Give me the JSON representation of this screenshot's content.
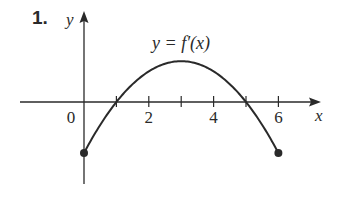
{
  "problem_number": "1.",
  "chart_data": {
    "type": "line",
    "title": "",
    "curve_label": "y = f′(x)",
    "xlabel": "x",
    "ylabel": "y",
    "origin_label": "0",
    "x_ticks": [
      1,
      2,
      3,
      4,
      5,
      6
    ],
    "x_tick_labels": [
      "2",
      "4",
      "6"
    ],
    "x_tick_label_values": [
      2,
      4,
      6
    ],
    "xlim": [
      0,
      6
    ],
    "function": "f'(x) = -k(x-1)(x-5)",
    "roots": [
      1,
      5
    ],
    "vertex": {
      "x": 3,
      "y": 4
    },
    "endpoints": [
      {
        "x": 0,
        "y": -5,
        "closed": true
      },
      {
        "x": 6,
        "y": -5,
        "closed": true
      }
    ],
    "x": [
      0,
      0.5,
      1,
      1.5,
      2,
      2.5,
      3,
      3.5,
      4,
      4.5,
      5,
      5.5,
      6
    ],
    "values": [
      -5,
      -2.25,
      0,
      1.75,
      3,
      3.75,
      4,
      3.75,
      3,
      1.75,
      0,
      -2.25,
      -5
    ],
    "grid": false,
    "legend": "none"
  },
  "colors": {
    "ink": "#2a2a2a",
    "background": "#ffffff"
  }
}
